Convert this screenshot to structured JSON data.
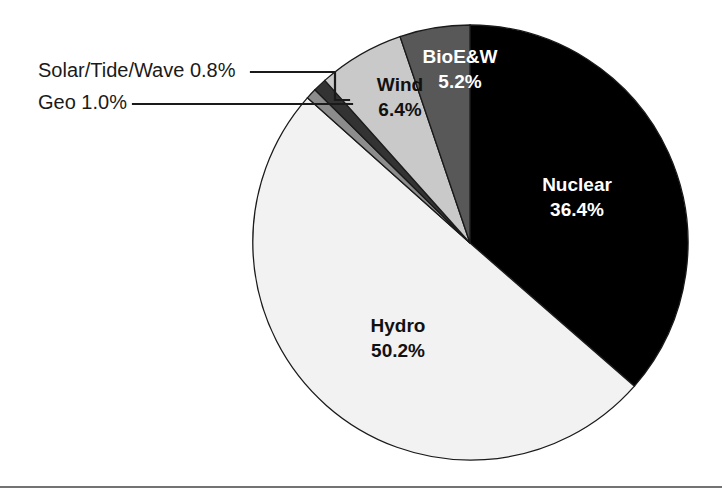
{
  "chart_data": {
    "type": "pie",
    "title": "",
    "categories": [
      "Nuclear",
      "Hydro",
      "Wind",
      "BioE&W",
      "Geo",
      "Solar/Tide/Wave"
    ],
    "values": [
      36.4,
      50.2,
      6.4,
      5.2,
      1.0,
      0.8
    ],
    "unit": "%",
    "start_angle_deg": 0,
    "direction": "clockwise",
    "legend": "none",
    "grid": false,
    "slices": [
      {
        "name": "Nuclear",
        "label": "Nuclear",
        "percent_text": "36.4%",
        "value": 36.4,
        "color": "#000000",
        "text_color": "#ffffff",
        "label_placement": "inside",
        "label_x": 577,
        "label_y": 186,
        "value_x": 577,
        "value_y": 211
      },
      {
        "name": "Hydro",
        "label": "Hydro",
        "percent_text": "50.2%",
        "value": 50.2,
        "color": "#f2f2f2",
        "text_color": "#111111",
        "label_placement": "inside",
        "label_x": 398,
        "label_y": 327,
        "value_x": 398,
        "value_y": 352
      },
      {
        "name": "Wind",
        "label": "Wind",
        "percent_text": "6.4%",
        "value": 6.4,
        "color": "#c9c9c9",
        "text_color": "#111111",
        "label_placement": "inside",
        "label_x": 400,
        "label_y": 86,
        "value_x": 400,
        "value_y": 111
      },
      {
        "name": "BioE&W",
        "label": "BioE&W",
        "percent_text": "5.2%",
        "value": 5.2,
        "color": "#585858",
        "text_color": "#ffffff",
        "label_placement": "inside",
        "label_x": 460,
        "label_y": 58,
        "value_x": 460,
        "value_y": 83
      },
      {
        "name": "Geo",
        "label": "Geo 1.0%",
        "percent_text": "1.0%",
        "value": 1.0,
        "color": "#333333",
        "text_color": "#1a1a1a",
        "label_placement": "callout",
        "label_x": 38,
        "label_y": 104
      },
      {
        "name": "Solar/Tide/Wave",
        "label": "Solar/Tide/Wave 0.8%",
        "percent_text": "0.8%",
        "value": 0.8,
        "color": "#8c8c8c",
        "text_color": "#1a1a1a",
        "label_placement": "callout",
        "label_x": 38,
        "label_y": 72
      }
    ]
  },
  "geometry": {
    "center_x": 470,
    "center_y": 243,
    "radius": 218
  },
  "callouts": {
    "solar": {
      "text": "Solar/Tide/Wave 0.8%",
      "line_path": "M 251 72 L 335 72 L 335 100 L 349 100"
    },
    "geo": {
      "text": "Geo 1.0%",
      "line_path": "M 133 104 L 335 104 L 352 104"
    }
  },
  "footer": {
    "rule_visible": true
  }
}
